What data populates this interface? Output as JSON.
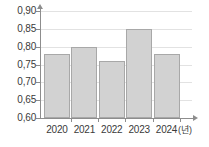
{
  "chart_data": {
    "type": "bar",
    "title": "",
    "xlabel": "(년)",
    "ylabel": "",
    "categories": [
      "2020",
      "2021",
      "2022",
      "2023",
      "2024"
    ],
    "values": [
      0.78,
      0.8,
      0.76,
      0.85,
      0.78
    ],
    "value_labels": [
      "0,78",
      "0,80",
      "0,76",
      "0,85",
      "0,78"
    ],
    "ylim": [
      0.6,
      0.9
    ],
    "ytick_step": 0.05,
    "ytick_labels": [
      "0,90",
      "0,85",
      "0,80",
      "0,75",
      "0,70",
      "0,65",
      "0,60"
    ],
    "ytick_values": [
      0.9,
      0.85,
      0.8,
      0.75,
      0.7,
      0.65,
      0.6
    ],
    "grid": true,
    "legend": false,
    "decimal_separator": ",",
    "colors": {
      "bar_fill": "#d2d2d2",
      "bar_border": "#a8a8a8",
      "axis": "#8d8d8d",
      "gridline": "#e2e2e2",
      "text": "#3a3a3a",
      "background": "#ffffff"
    }
  }
}
